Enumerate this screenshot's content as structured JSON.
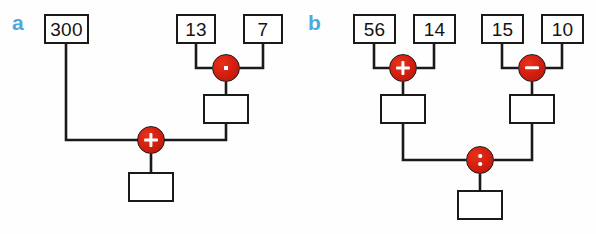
{
  "figure": {
    "background_color": "#fefefe",
    "line_color": "#1a1a1a",
    "operator_color": "#d41f10",
    "label_color": "#4fa8dc"
  },
  "panels": [
    {
      "label": "a",
      "expression": "300 + 13 · 7",
      "inputs": [
        {
          "name": "input-300",
          "value": "300"
        },
        {
          "name": "input-13",
          "value": "13"
        },
        {
          "name": "input-7",
          "value": "7"
        }
      ],
      "operators": [
        {
          "name": "operator-times",
          "symbol": "·",
          "kind": "times"
        },
        {
          "name": "operator-plus",
          "symbol": "+",
          "kind": "plus"
        }
      ],
      "results": [
        {
          "name": "result-intermediate",
          "value": ""
        },
        {
          "name": "result-final",
          "value": ""
        }
      ]
    },
    {
      "label": "b",
      "expression": "(56 + 14) : (15 − 10)",
      "inputs": [
        {
          "name": "input-56",
          "value": "56"
        },
        {
          "name": "input-14",
          "value": "14"
        },
        {
          "name": "input-15",
          "value": "15"
        },
        {
          "name": "input-10",
          "value": "10"
        }
      ],
      "operators": [
        {
          "name": "operator-plus",
          "symbol": "+",
          "kind": "plus"
        },
        {
          "name": "operator-minus",
          "symbol": "−",
          "kind": "minus"
        },
        {
          "name": "operator-divide",
          "symbol": ":",
          "kind": "divide"
        }
      ],
      "results": [
        {
          "name": "result-left-intermediate",
          "value": ""
        },
        {
          "name": "result-right-intermediate",
          "value": ""
        },
        {
          "name": "result-final",
          "value": ""
        }
      ]
    }
  ]
}
